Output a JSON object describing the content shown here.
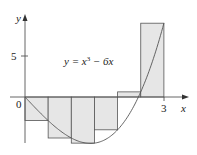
{
  "figure": {
    "equation": "y = x³ − 6x",
    "equation_parts": {
      "pre": "y = x",
      "sup": "3",
      "post": " − 6x"
    },
    "x_axis_label": "x",
    "y_axis_label": "y",
    "origin_label": "0",
    "x_tick_label": "3",
    "y_tick_label": "5"
  },
  "chart_data": {
    "type": "bar",
    "function": "x^3 - 6x",
    "interval": [
      0,
      3
    ],
    "n": 6,
    "method": "right endpoints",
    "x_edges": [
      0,
      0.5,
      1,
      1.5,
      2,
      2.5,
      3
    ],
    "categories": [
      "[0,0.5]",
      "[0.5,1]",
      "[1,1.5]",
      "[1.5,2]",
      "[2,2.5]",
      "[2.5,3]"
    ],
    "values": [
      -2.875,
      -5,
      -5.625,
      -4,
      0.625,
      9
    ],
    "xlabel": "x",
    "ylabel": "y",
    "x_ticks": [
      0,
      3
    ],
    "y_ticks": [
      5
    ],
    "xlim": [
      0,
      3.4
    ],
    "ylim": [
      -7,
      10
    ],
    "grid": false
  }
}
